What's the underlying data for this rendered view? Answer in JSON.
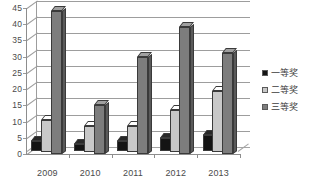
{
  "chart_data": {
    "type": "bar",
    "title": "",
    "subtitle": "",
    "xlabel": "",
    "ylabel": "",
    "categories": [
      "2009",
      "2010",
      "2011",
      "2012",
      "2013"
    ],
    "series": [
      {
        "name": "一等奖",
        "color": "#141414",
        "values": [
          3,
          2,
          3,
          4,
          5
        ]
      },
      {
        "name": "二等奖",
        "color": "#c8c8c8",
        "values": [
          10,
          8,
          8,
          13,
          19
        ]
      },
      {
        "name": "三等奖",
        "color": "#7d7d7d",
        "values": [
          44,
          15,
          30,
          39,
          31
        ]
      }
    ],
    "ylim": [
      0,
      45
    ],
    "ytick_step": 5,
    "yticks": [
      "0",
      "5",
      "10",
      "15",
      "20",
      "25",
      "30",
      "35",
      "40",
      "45"
    ],
    "grid": true,
    "legend_position": "right",
    "style": "3d-clustered-column"
  },
  "legend": {
    "items": [
      {
        "label": "一等奖"
      },
      {
        "label": "二等奖"
      },
      {
        "label": "三等奖"
      }
    ]
  },
  "colors": {
    "series_1": "#141414",
    "series_2": "#c8c8c8",
    "series_3": "#7d7d7d",
    "gridline": "#9d9d9d",
    "axis": "#8d8d8d",
    "text": "#4a4a4a",
    "background": "#ffffff"
  }
}
